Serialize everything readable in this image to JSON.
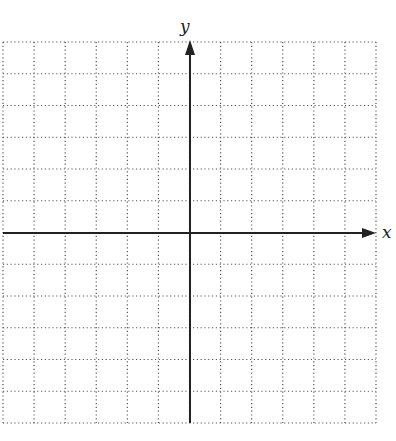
{
  "diagram": {
    "type": "coordinate-grid",
    "x_axis_label": "x",
    "y_axis_label": "y",
    "grid": {
      "columns": 12,
      "rows": 12,
      "left": 3,
      "right": 376,
      "top": 42,
      "bottom": 423,
      "origin_x": 190,
      "origin_y": 233,
      "line_style": "dotted",
      "line_color": "#555555",
      "axis_color": "#222222"
    }
  }
}
